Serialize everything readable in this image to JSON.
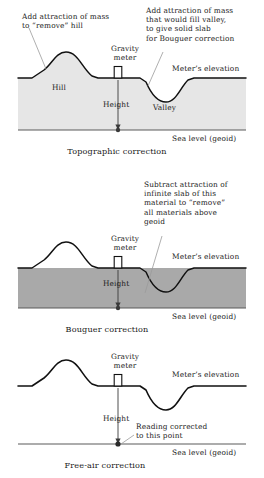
{
  "figure": {
    "colors": {
      "terrain_line": "#111111",
      "sea_level_line": "#5b5b5b",
      "fill_light": "#e6e6e6",
      "fill_dark": "#a9a9a9",
      "leader_line": "#9a9a9a",
      "text": "#1a1a1a"
    }
  },
  "panels": [
    {
      "id": "topographic",
      "caption": "Topographic correction",
      "annotations": {
        "left_note": "Add attraction of mass\nto “remove” hill",
        "right_note": "Add attraction of mass\nthat would fill valley,\nto give solid slab\nfor Bouguer correction"
      },
      "labels": {
        "hill": "Hill",
        "valley": "Valley",
        "gravity_meter": "Gravity\nmeter",
        "height": "Height",
        "meters_elevation": "Meter’s elevation",
        "sea_level": "Sea level (geoid)"
      }
    },
    {
      "id": "bouguer",
      "caption": "Bouguer correction",
      "annotations": {
        "right_note": "Subtract attraction of\ninfinite slab of this\nmaterial to “remove”\nall materials above\ngeoid"
      },
      "labels": {
        "gravity_meter": "Gravity\nmeter",
        "height": "Height",
        "meters_elevation": "Meter’s elevation",
        "sea_level": "Sea level (geoid)"
      }
    },
    {
      "id": "freeair",
      "caption": "Free-air correction",
      "annotations": {
        "reading_note": "Reading corrected\nto this point"
      },
      "labels": {
        "gravity_meter": "Gravity\nmeter",
        "height": "Height",
        "meters_elevation": "Meter’s elevation",
        "sea_level": "Sea level (geoid)"
      }
    }
  ]
}
